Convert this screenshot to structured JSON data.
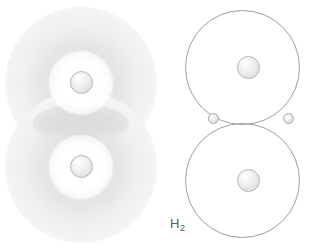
{
  "figure": {
    "title": "H2",
    "background_color": "#ffffff"
  },
  "label": {
    "element_symbol": "H",
    "subscript": "2",
    "full_text": "H2",
    "color": "#5a5a5a"
  },
  "models": {
    "electron_cloud": {
      "name": "electron cloud model",
      "atom_count": 2,
      "atoms": [
        {
          "name": "hydrogen-atom-top",
          "nucleus_label": "nucleus"
        },
        {
          "name": "hydrogen-atom-bottom",
          "nucleus_label": "nucleus"
        }
      ],
      "overlap_region": "shared electron density",
      "cloud_color": "#e4e4e4",
      "overlap_color": "#dcdcdc",
      "nucleus_color": "#ebebeb"
    },
    "bohr": {
      "name": "overlapping orbit model",
      "orbit_count": 2,
      "orbits": [
        {
          "name": "orbit-top"
        },
        {
          "name": "orbit-bottom"
        }
      ],
      "nuclei": [
        {
          "name": "nucleus-top"
        },
        {
          "name": "nucleus-bottom"
        }
      ],
      "shared_electrons": [
        {
          "name": "electron-left"
        },
        {
          "name": "electron-right"
        }
      ],
      "orbit_stroke_color": "#9e9e9e",
      "nucleus_color": "#ebebeb",
      "electron_color": "#e3e3e3"
    }
  }
}
